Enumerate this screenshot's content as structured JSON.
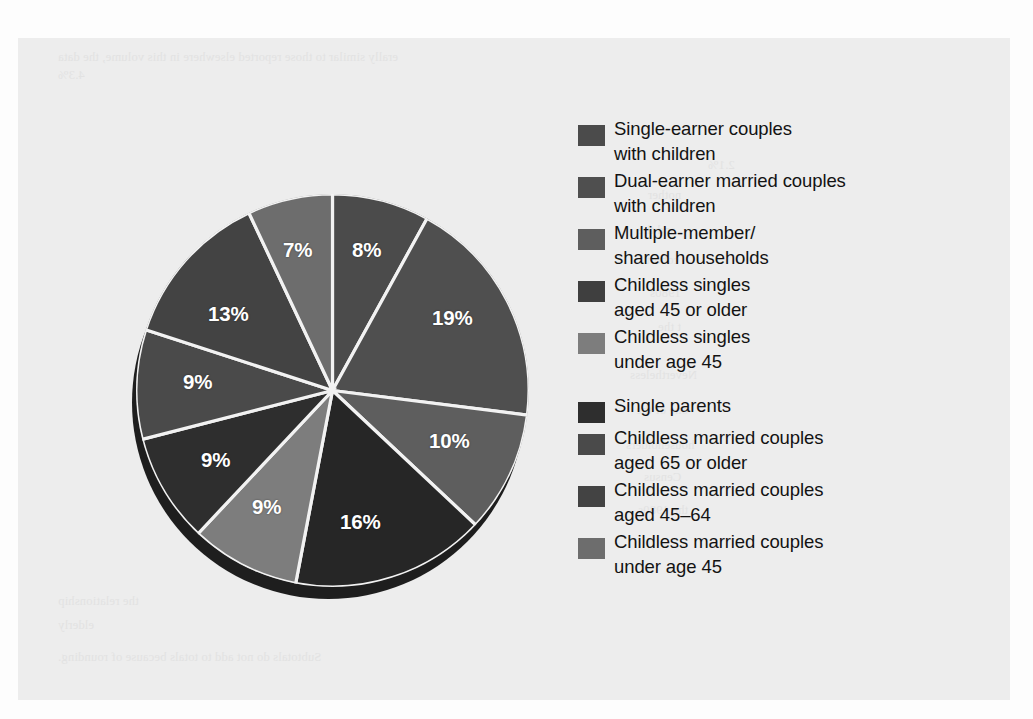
{
  "chart_data": {
    "type": "pie",
    "title": "",
    "subtitle": "",
    "xlabel": "",
    "ylabel": "",
    "legend_position": "right",
    "grid": false,
    "units": "percent",
    "start_angle_deg": 0,
    "direction": "clockwise",
    "categories": [
      "Single-earner couples with children",
      "Dual-earner married couples with children",
      "Multiple-member/ shared households",
      "Childless singles aged 45 or older",
      "Childless singles under age 45",
      "Single parents",
      "Childless married couples aged 65 or older",
      "Childless married couples aged 45–64",
      "Childless married couples under age 45"
    ],
    "values": [
      8,
      19,
      10,
      16,
      9,
      9,
      9,
      13,
      7
    ],
    "data_labels": [
      "8%",
      "19%",
      "10%",
      "16%",
      "9%",
      "9%",
      "9%",
      "13%",
      "7%"
    ],
    "total": 100,
    "slice_colors": [
      "#4b4b4b",
      "#4f4f4f",
      "#5e5e5e",
      "#262626",
      "#7d7d7d",
      "#2e2e2e",
      "#4a4a4a",
      "#434343",
      "#6d6d6d"
    ]
  },
  "pie": {
    "labels": [
      {
        "text": "8%",
        "left": 224,
        "top": 48
      },
      {
        "text": "19%",
        "left": 304,
        "top": 116
      },
      {
        "text": "10%",
        "left": 301,
        "top": 239
      },
      {
        "text": "16%",
        "left": 212,
        "top": 320
      },
      {
        "text": "9%",
        "left": 124,
        "top": 305
      },
      {
        "text": "9%",
        "left": 73,
        "top": 258
      },
      {
        "text": "9%",
        "left": 55,
        "top": 180
      },
      {
        "text": "13%",
        "left": 80,
        "top": 112
      },
      {
        "text": "7%",
        "left": 155,
        "top": 48
      }
    ]
  },
  "legend": {
    "items": [
      {
        "label": "Single-earner couples\nwith children",
        "color": "#4b4b4b",
        "gap_before": false
      },
      {
        "label": "Dual-earner married couples\nwith children",
        "color": "#4f4f4f",
        "gap_before": false
      },
      {
        "label": "Multiple-member/\nshared households",
        "color": "#5e5e5e",
        "gap_before": false
      },
      {
        "label": "Childless singles\naged 45 or older",
        "color": "#3f3f3f",
        "gap_before": false
      },
      {
        "label": "Childless singles\nunder age 45",
        "color": "#7d7d7d",
        "gap_before": false
      },
      {
        "label": "Single parents",
        "color": "#2e2e2e",
        "gap_before": true
      },
      {
        "label": "Childless married couples\naged 65 or older",
        "color": "#4a4a4a",
        "gap_before": false
      },
      {
        "label": "Childless married couples\naged 45–64",
        "color": "#434343",
        "gap_before": false
      },
      {
        "label": "Childless married couples\nunder age 45",
        "color": "#6d6d6d",
        "gap_before": false
      }
    ]
  },
  "page": {
    "background_color": "#ededed",
    "margin_color": "#fdfdfd",
    "ghost_text": [
      {
        "text": "erally similar to those reported elsewhere in this volume, the data",
        "left": 40,
        "top": 12
      },
      {
        "text": "4.3%",
        "left": 40,
        "top": 30
      },
      {
        "text": "2.1%",
        "left": 690,
        "top": 120
      },
      {
        "text": "nother",
        "left": 630,
        "top": 150
      },
      {
        "text": "and the",
        "left": 620,
        "top": 185
      },
      {
        "text": "cohort",
        "left": 628,
        "top": 215
      },
      {
        "text": "1980s",
        "left": 632,
        "top": 248
      },
      {
        "text": "t the",
        "left": 640,
        "top": 282
      },
      {
        "text": "Nevertheless",
        "left": 612,
        "top": 330
      },
      {
        "text": "one of the",
        "left": 618,
        "top": 365
      },
      {
        "text": "householders",
        "left": 608,
        "top": 400
      },
      {
        "text": "Census",
        "left": 626,
        "top": 432
      },
      {
        "text": "the 1980s",
        "left": 620,
        "top": 465
      },
      {
        "text": "the relationship",
        "left": 40,
        "top": 556
      },
      {
        "text": "elderly",
        "left": 40,
        "top": 580
      },
      {
        "text": "Subtotals do not add to totals because of rounding.",
        "left": 40,
        "top": 612
      }
    ]
  }
}
